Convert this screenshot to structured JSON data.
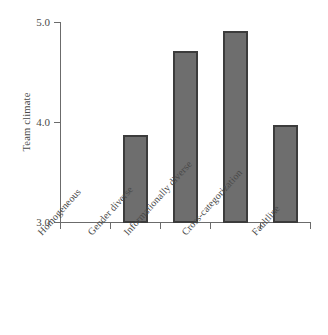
{
  "chart_data": {
    "type": "bar",
    "title": "",
    "subtitle": "",
    "xlabel": "",
    "ylabel": "Team climate",
    "categories": [
      "Homogeneous",
      "Gender diverse",
      "Informationally diverse",
      "Cross-categorization",
      "Faultline"
    ],
    "values": [
      4.26,
      3.86,
      4.7,
      4.9,
      3.96
    ],
    "ylim": [
      3.0,
      5.0
    ],
    "ytick_labels": [
      "3.0",
      "4.0",
      "5.0"
    ],
    "ytick_values": [
      3.0,
      4.0,
      5.0
    ],
    "grid": false,
    "legend": false,
    "legend_position": "none",
    "bar_color": "#6e6e6e",
    "bar_edge_color": "#3c3c3c",
    "axis_color": "#6b6b6b",
    "text_color": "#4a4a4a",
    "background_color": "#ffffff",
    "category_label_rotation": -48
  }
}
